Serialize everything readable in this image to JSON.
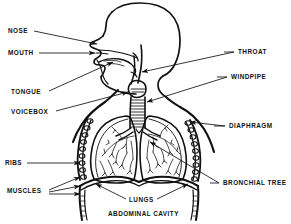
{
  "diagram": {
    "type": "anatomical-line-diagram",
    "orientation": "head-in-left-facing-profile-with-thorax",
    "stroke_color": "#111111",
    "background_color": "#ffffff",
    "labels": [
      {
        "id": "nose",
        "text": "NOSE",
        "side": "left",
        "x": 8,
        "y": 33
      },
      {
        "id": "mouth",
        "text": "MOUTH",
        "side": "left",
        "x": 8,
        "y": 55
      },
      {
        "id": "tongue",
        "text": "TONGUE",
        "side": "left",
        "x": 11,
        "y": 94
      },
      {
        "id": "voicebox",
        "text": "VOICEBOX",
        "side": "left",
        "x": 11,
        "y": 114
      },
      {
        "id": "ribs",
        "text": "RIBS",
        "side": "left",
        "x": 5,
        "y": 165
      },
      {
        "id": "muscles",
        "text": "MUSCLES",
        "side": "left",
        "x": 7,
        "y": 193
      },
      {
        "id": "throat",
        "text": "THROAT",
        "side": "right",
        "x": 238,
        "y": 54
      },
      {
        "id": "windpipe",
        "text": "WINDPIPE",
        "side": "right",
        "x": 231,
        "y": 79
      },
      {
        "id": "diaphragm",
        "text": "DIAPHRAGM",
        "side": "right",
        "x": 229,
        "y": 128
      },
      {
        "id": "bronchial-tree",
        "text": "BRONCHIAL  TREE",
        "side": "right",
        "x": 223,
        "y": 185
      },
      {
        "id": "lungs",
        "text": "LUNGS",
        "side": "bottom",
        "x": 129,
        "y": 202
      },
      {
        "id": "abdominal-cavity",
        "text": "ABDOMINAL  CAVITY",
        "side": "bottom",
        "x": 108,
        "y": 216
      }
    ]
  }
}
